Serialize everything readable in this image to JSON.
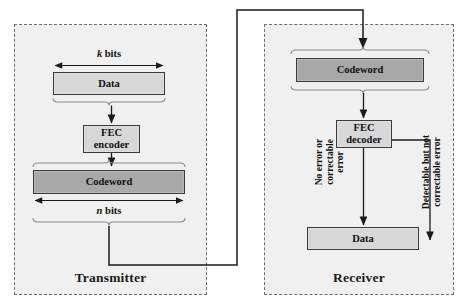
{
  "diagram": {
    "colors": {
      "panel_fill": "#f0f0f0",
      "panel_border": "#6e6e6e",
      "box_light": "#d7d7d7",
      "box_dark": "#a8a8a8",
      "box_border": "#3a3a3a",
      "line": "#1a1a1a"
    }
  },
  "transmitter": {
    "title": "Transmitter",
    "k_bits_label": "k bits",
    "k_bits_italic_symbol": "k",
    "k_bits_unit": " bits",
    "n_bits_label": "n bits",
    "n_bits_italic_symbol": "n",
    "n_bits_unit": " bits",
    "blocks": [
      {
        "id": "tx-data",
        "label": "Data",
        "fill": "light"
      },
      {
        "id": "tx-fec",
        "label": "FEC\ndecoder",
        "line1": "FEC",
        "line2": "encoder",
        "fill": "light"
      },
      {
        "id": "tx-codeword",
        "label": "Codeword",
        "fill": "dark"
      }
    ]
  },
  "receiver": {
    "title": "Receiver",
    "blocks": [
      {
        "id": "rx-codeword",
        "label": "Codeword",
        "fill": "dark"
      },
      {
        "id": "rx-fec",
        "line1": "FEC",
        "line2": "decoder",
        "fill": "light"
      },
      {
        "id": "rx-data",
        "label": "Data",
        "fill": "light"
      }
    ],
    "branch_labels": {
      "no_error": "No error or\ncorrectable\nerror",
      "detectable": "Detectable but not\ncorrectable error"
    }
  }
}
